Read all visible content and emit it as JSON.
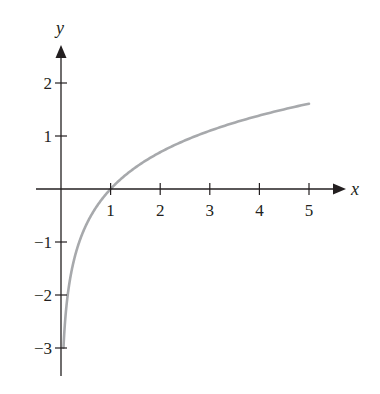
{
  "chart_data": {
    "type": "line",
    "title": "",
    "xlabel": "x",
    "ylabel": "y",
    "function": "y = ln(x)",
    "xlim": [
      0,
      5
    ],
    "ylim": [
      -3,
      2
    ],
    "grid": false,
    "legend": null,
    "x_ticks": [
      1,
      2,
      3,
      4,
      5
    ],
    "x_tick_labels": [
      "1",
      "2",
      "3",
      "4",
      "5"
    ],
    "y_ticks": [
      -3,
      -2,
      -1,
      1,
      2
    ],
    "y_tick_labels": [
      "−3",
      "−2",
      "−1",
      "1",
      "2"
    ],
    "series": [
      {
        "name": "ln(x)",
        "color": "#a7a9ac",
        "x": [
          0.05,
          0.1,
          0.2,
          0.3,
          0.5,
          0.75,
          1,
          1.5,
          2,
          2.5,
          3,
          3.5,
          4,
          4.5,
          5
        ],
        "values": [
          -3.0,
          -2.3,
          -1.61,
          -1.2,
          -0.69,
          -0.29,
          0,
          0.41,
          0.69,
          0.92,
          1.1,
          1.25,
          1.39,
          1.5,
          1.61
        ]
      }
    ]
  },
  "colors": {
    "axis": "#231f20",
    "curve": "#a7a9ac"
  }
}
